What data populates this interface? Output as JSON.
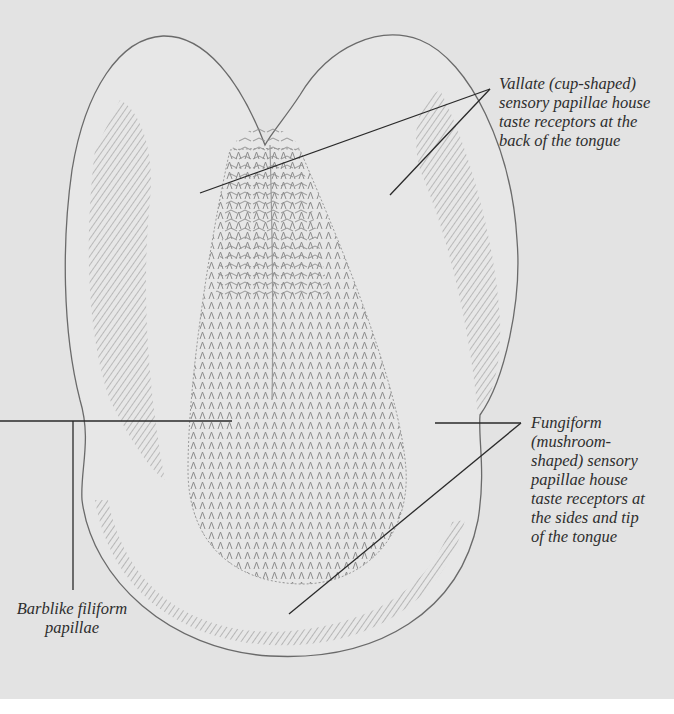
{
  "figure": {
    "background_color": "#e3e3e3",
    "line_color": "#2a2a2a",
    "labels": [
      {
        "id": "vallate",
        "lines": [
          "Vallate (cup-shaped)",
          "sensory papillae house",
          "taste receptors at the",
          "back of the tongue"
        ]
      },
      {
        "id": "fungiform",
        "lines": [
          "Fungiform",
          "(mushroom-",
          "shaped) sensory",
          "papillae house",
          "taste receptors at",
          "the sides and tip",
          "of the tongue"
        ]
      },
      {
        "id": "filiform",
        "lines": [
          "Barblike filiform",
          "papillae"
        ]
      }
    ]
  }
}
